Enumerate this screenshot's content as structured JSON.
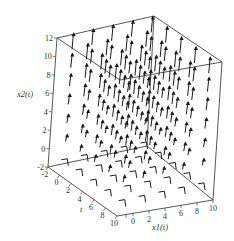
{
  "chart_data": {
    "type": "vector-field-3d",
    "title": "",
    "axes": {
      "t": {
        "label": "t",
        "range": [
          -2,
          10
        ],
        "ticks": [
          "-2",
          "0",
          "2",
          "4",
          "6",
          "8",
          "10"
        ]
      },
      "x1": {
        "label": "x1(t)",
        "range": [
          0,
          10
        ],
        "ticks": [
          "10",
          "0",
          "2",
          "4",
          "6",
          "8",
          "10"
        ]
      },
      "x2": {
        "label": "x2(t)",
        "range": [
          -2,
          12
        ],
        "ticks": [
          "-2",
          "0",
          "2",
          "4",
          "6",
          "8",
          "10",
          "12"
        ]
      }
    },
    "grid": false,
    "box": true,
    "colors": {
      "arrows": "#1a1a1a",
      "box": "#444444",
      "text": "#333333"
    }
  },
  "labels": {
    "x2_axis": "x2(t)",
    "t_axis": "t",
    "x1_axis": "x1(t)"
  },
  "x2_ticks": [
    "12",
    "10",
    "8",
    "6",
    "4",
    "2",
    "0",
    "-2"
  ],
  "t_ticks": [
    "-2",
    "0",
    "2",
    "4",
    "6",
    "8",
    "10"
  ],
  "x1_ticks": [
    "10",
    "0",
    "2",
    "4",
    "6",
    "8",
    "10"
  ]
}
